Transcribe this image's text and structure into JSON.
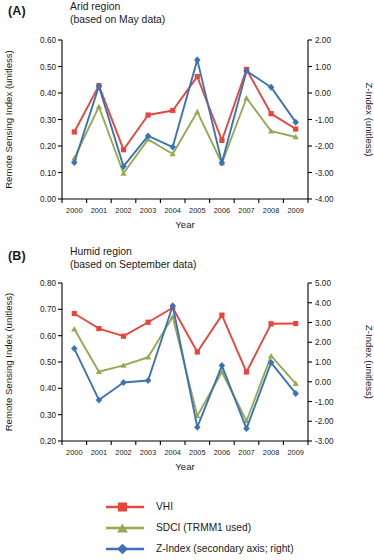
{
  "figure": {
    "xlabel": "Year",
    "ylabel_left": "Remote Sensing Index (unitless)",
    "ylabel_right": "Z-Index (unitless)"
  },
  "panels": [
    {
      "letter": "(A)",
      "title_line1": "Arid region",
      "title_line2": "(based on May data)"
    },
    {
      "letter": "(B)",
      "title_line1": "Humid region",
      "title_line2": "(based on September data)"
    }
  ],
  "legend": {
    "items": [
      {
        "label": "VHI",
        "color": "#e8453c",
        "marker": "square"
      },
      {
        "label": "SDCI (TRMM1 used)",
        "color": "#94ab54",
        "marker": "triangle"
      },
      {
        "label": "Z-Index (secondary axis; right)",
        "color": "#3d73b5",
        "marker": "diamond"
      }
    ]
  },
  "chart_data": [
    {
      "id": "panel-a",
      "type": "line",
      "title": "Arid region (based on May data)",
      "xlabel": "Year",
      "ylabel": "Remote Sensing Index (unitless)",
      "ylabel_secondary": "Z-Index (unitless)",
      "grid": false,
      "legend_position": "bottom",
      "categories": [
        2000,
        2001,
        2002,
        2003,
        2004,
        2005,
        2006,
        2007,
        2008,
        2009
      ],
      "ylim": [
        0.0,
        0.6
      ],
      "yticks": [
        "0.00",
        "0.10",
        "0.20",
        "0.30",
        "0.40",
        "0.50",
        "0.60"
      ],
      "ylim_secondary": [
        -4.0,
        2.0
      ],
      "yticks_secondary": [
        "-4.00",
        "-3.00",
        "-2.00",
        "-1.00",
        "0.00",
        "1.00",
        "2.00"
      ],
      "series": [
        {
          "name": "VHI",
          "axis": "left",
          "color": "#e8453c",
          "marker": "square",
          "values": [
            0.253,
            0.428,
            0.186,
            0.317,
            0.334,
            0.462,
            0.221,
            0.489,
            0.322,
            0.264
          ]
        },
        {
          "name": "SDCI (TRMM1 used)",
          "axis": "left",
          "color": "#94ab54",
          "marker": "triangle",
          "values": [
            0.154,
            0.348,
            0.097,
            0.225,
            0.17,
            0.329,
            0.135,
            0.381,
            0.256,
            0.234
          ]
        },
        {
          "name": "Z-Index (secondary axis; right)",
          "axis": "right",
          "color": "#3d73b5",
          "marker": "diamond",
          "values": [
            -2.62,
            0.26,
            -2.77,
            -1.62,
            -2.04,
            1.25,
            -2.63,
            0.83,
            0.22,
            -1.1
          ]
        }
      ]
    },
    {
      "id": "panel-b",
      "type": "line",
      "title": "Humid region (based on September data)",
      "xlabel": "Year",
      "ylabel": "Remote Sensing Index (unitless)",
      "ylabel_secondary": "Z-Index (unitless)",
      "grid": false,
      "legend_position": "bottom",
      "categories": [
        2000,
        2001,
        2002,
        2003,
        2004,
        2005,
        2006,
        2007,
        2008,
        2009
      ],
      "ylim": [
        0.2,
        0.8
      ],
      "yticks": [
        "0.20",
        "0.30",
        "0.40",
        "0.50",
        "0.60",
        "0.70",
        "0.80"
      ],
      "ylim_secondary": [
        -3.0,
        5.0
      ],
      "yticks_secondary": [
        "-3.00",
        "-2.00",
        "-1.00",
        "0.00",
        "1.00",
        "2.00",
        "3.00",
        "4.00",
        "5.00"
      ],
      "series": [
        {
          "name": "VHI",
          "axis": "left",
          "color": "#e8453c",
          "marker": "square",
          "values": [
            0.684,
            0.627,
            0.598,
            0.651,
            0.706,
            0.538,
            0.678,
            0.462,
            0.645,
            0.646
          ]
        },
        {
          "name": "SDCI (TRMM1 used)",
          "axis": "left",
          "color": "#94ab54",
          "marker": "triangle",
          "values": [
            0.625,
            0.463,
            0.487,
            0.518,
            0.672,
            0.295,
            0.462,
            0.276,
            0.523,
            0.418
          ]
        },
        {
          "name": "Z-Index (secondary axis; right)",
          "axis": "right",
          "color": "#3d73b5",
          "marker": "diamond",
          "values": [
            1.68,
            -0.92,
            -0.04,
            0.06,
            3.85,
            -2.3,
            0.82,
            -2.37,
            0.97,
            -0.59
          ]
        }
      ]
    }
  ]
}
